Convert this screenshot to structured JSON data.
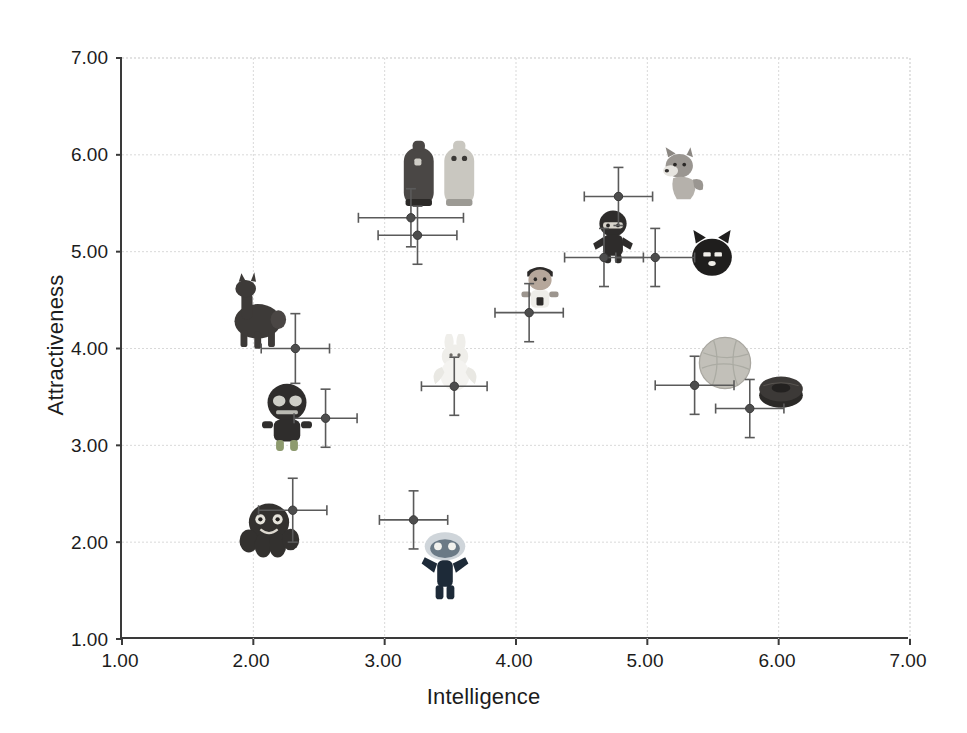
{
  "chart_data": {
    "type": "scatter",
    "title": "",
    "xlabel": "Intelligence",
    "ylabel": "Attractiveness",
    "xlim": [
      1.0,
      7.0
    ],
    "ylim": [
      1.0,
      7.0
    ],
    "xticks": [
      "1.00",
      "2.00",
      "3.00",
      "4.00",
      "5.00",
      "6.00",
      "7.00"
    ],
    "yticks": [
      "1.00",
      "2.00",
      "3.00",
      "4.00",
      "5.00",
      "6.00",
      "7.00"
    ],
    "grid": true,
    "legend": "none",
    "error_bars": "both",
    "points": [
      {
        "label": "octopus",
        "x": 2.3,
        "y": 2.33,
        "xerr": 0.26,
        "yerr": 0.33,
        "img": "octopus-toy"
      },
      {
        "label": "zombie-doll",
        "x": 2.55,
        "y": 3.28,
        "xerr": 0.24,
        "yerr": 0.3,
        "img": "zombie-doll-toy"
      },
      {
        "label": "alpaca",
        "x": 2.32,
        "y": 4.0,
        "xerr": 0.26,
        "yerr": 0.36,
        "img": "alpaca-toy"
      },
      {
        "label": "blue-monster",
        "x": 3.22,
        "y": 2.23,
        "xerr": 0.26,
        "yerr": 0.3,
        "img": "blue-monster-toy"
      },
      {
        "label": "angel-bunny",
        "x": 3.53,
        "y": 3.61,
        "xerr": 0.25,
        "yerr": 0.3,
        "img": "angel-bunny-toy"
      },
      {
        "label": "dark-bottle",
        "x": 3.2,
        "y": 5.35,
        "xerr": 0.4,
        "yerr": 0.3,
        "img": "bottle-pair-toy"
      },
      {
        "label": "light-bottle",
        "x": 3.25,
        "y": 5.17,
        "xerr": 0.3,
        "yerr": 0.3,
        "img": ""
      },
      {
        "label": "astronaut-doll",
        "x": 4.1,
        "y": 4.37,
        "xerr": 0.26,
        "yerr": 0.3,
        "img": "astronaut-doll-toy"
      },
      {
        "label": "ninja-doll",
        "x": 4.67,
        "y": 4.94,
        "xerr": 0.3,
        "yerr": 0.3,
        "img": "ninja-doll-toy"
      },
      {
        "label": "husky-dog",
        "x": 4.78,
        "y": 5.57,
        "xerr": 0.26,
        "yerr": 0.3,
        "img": "husky-dog-toy"
      },
      {
        "label": "black-cat",
        "x": 5.06,
        "y": 4.94,
        "xerr": 0.3,
        "yerr": 0.3,
        "img": "black-cat-toy"
      },
      {
        "label": "yarn-ball",
        "x": 5.36,
        "y": 3.62,
        "xerr": 0.3,
        "yerr": 0.3,
        "img": "yarn-ball-toy"
      },
      {
        "label": "donut-cushion",
        "x": 5.78,
        "y": 3.38,
        "xerr": 0.26,
        "yerr": 0.3,
        "img": "donut-cushion-toy"
      }
    ]
  },
  "axes": {
    "x_title": "Intelligence",
    "y_title": "Attractiveness"
  },
  "colors": {
    "axis": "#3a3a3a",
    "grid": "#d9d9d9",
    "marker": "#4d4d4d",
    "errorbar": "#5a5a5a",
    "background": "#ffffff"
  }
}
